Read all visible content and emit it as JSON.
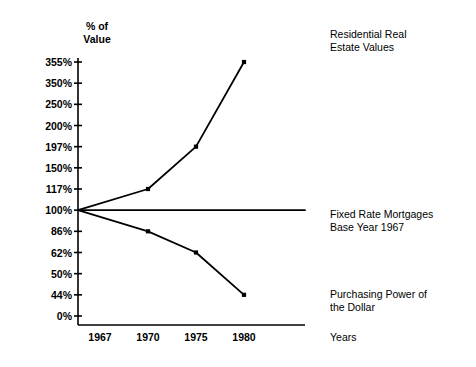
{
  "chart_data": {
    "type": "line",
    "title": "",
    "xlabel": "Years",
    "ylabel": "% of\nValue",
    "x": [
      "1967",
      "1970",
      "1975",
      "1980"
    ],
    "categories": [
      "1967",
      "1970",
      "1975",
      "1980"
    ],
    "ytick_labels": [
      "355%",
      "350%",
      "250%",
      "200%",
      "197%",
      "150%",
      "117%",
      "100%",
      "86%",
      "62%",
      "50%",
      "44%",
      "0%"
    ],
    "ytick_values": [
      355,
      350,
      250,
      200,
      197,
      150,
      117,
      100,
      86,
      62,
      50,
      44,
      0
    ],
    "y_scale": "ordinal-evenly-spaced",
    "grid": false,
    "legend": "right-inline-annotations",
    "series": [
      {
        "name": "Residential Real Estate Values",
        "values": [
          100,
          117,
          197,
          355
        ],
        "markers": true,
        "annotation": "Residential Real\nEstate Values"
      },
      {
        "name": "Fixed Rate Mortgages Base Year 1967",
        "values": [
          100,
          100,
          100,
          100
        ],
        "markers": false,
        "annotation": "Fixed Rate Mortgages\nBase Year 1967"
      },
      {
        "name": "Purchasing Power of the Dollar",
        "values": [
          100,
          86,
          62,
          44
        ],
        "markers": true,
        "annotation": "Purchasing Power of\nthe Dollar"
      }
    ],
    "colors": {
      "line": "#000000",
      "axis": "#000000",
      "background": "#ffffff",
      "text": "#000000"
    }
  },
  "axis": {
    "y_title": "% of\nValue",
    "x_title": "Years"
  },
  "annotations": {
    "residential": "Residential Real\nEstate Values",
    "fixed_rate": "Fixed Rate Mortgages\nBase Year 1967",
    "purchasing_power": "Purchasing Power of\nthe Dollar",
    "years": "Years"
  }
}
